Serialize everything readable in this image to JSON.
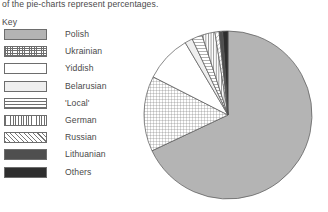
{
  "caption": "of the pie-charts represent percentages.",
  "key_title": "Key",
  "legend": {
    "items": [
      {
        "label": "Polish",
        "pattern": "solid-light",
        "swatch_color": "#b4b4b4"
      },
      {
        "label": "Ukrainian",
        "pattern": "grid",
        "swatch_color": "#ffffff"
      },
      {
        "label": "Yiddish",
        "pattern": "white",
        "swatch_color": "#ffffff"
      },
      {
        "label": "Belarusian",
        "pattern": "very-light",
        "swatch_color": "#efefef"
      },
      {
        "label": "'Local'",
        "pattern": "horizontal-lines",
        "swatch_color": "#ffffff"
      },
      {
        "label": "German",
        "pattern": "vertical-lines",
        "swatch_color": "#ffffff"
      },
      {
        "label": "Russian",
        "pattern": "diagonal-hatch",
        "swatch_color": "#ffffff"
      },
      {
        "label": "Lithuanian",
        "pattern": "dark-gray",
        "swatch_color": "#4f4f4f"
      },
      {
        "label": "Others",
        "pattern": "near-black",
        "swatch_color": "#2e2e2e"
      }
    ]
  },
  "chart_data": {
    "type": "pie",
    "title": "",
    "units": "percent",
    "start_angle_deg": 0,
    "direction": "clockwise",
    "center_px": [
      228,
      115
    ],
    "radius_px": 84,
    "outline_color": "#555555",
    "categories": [
      "Polish",
      "Ukrainian",
      "Yiddish",
      "Belarusian",
      "'Local'",
      "German",
      "Russian",
      "Lithuanian",
      "Others"
    ],
    "values": [
      68.0,
      14.5,
      9.0,
      1.5,
      2.0,
      2.5,
      0.8,
      0.7,
      1.0
    ],
    "legend_position": "left",
    "grid": false
  }
}
